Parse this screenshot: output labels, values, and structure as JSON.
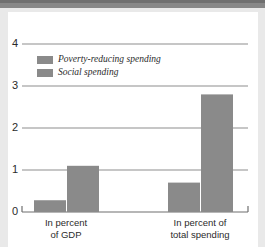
{
  "chart_data": {
    "type": "bar",
    "title": "",
    "xlabel": "",
    "ylabel": "",
    "categories": [
      "In percent of GDP",
      "In percent of total spending"
    ],
    "category_lines": [
      [
        "In percent",
        "of GDP"
      ],
      [
        "In percent of",
        "total spending"
      ]
    ],
    "series": [
      {
        "name": "Poverty-reducing spending",
        "values": [
          0.28,
          0.7
        ],
        "color": "#8a8a8a"
      },
      {
        "name": "Social spending",
        "values": [
          1.1,
          2.8
        ],
        "color": "#8a8a8a"
      }
    ],
    "yticks": [
      "0",
      "1",
      "2",
      "3",
      "4"
    ],
    "ylim": [
      0,
      4
    ],
    "grid": true,
    "legend_position": "top-left"
  },
  "colors": {
    "bar_gray": "#8a8a8a",
    "grid_line": "#8d8d8d",
    "axis_line": "#6f6f6f",
    "text": "#2b2b2b",
    "page_margin": "#e9e9e9",
    "top_band": "#878787",
    "card": "#ffffff"
  }
}
